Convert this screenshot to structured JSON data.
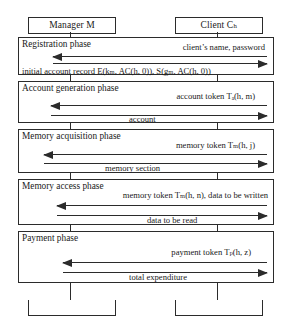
{
  "diagram": {
    "type": "sequence-diagram",
    "actors": [
      {
        "id": "manager",
        "label": "Manager M"
      },
      {
        "id": "client",
        "label": "Client Cₕ"
      }
    ],
    "footer_actors": [
      {
        "id": "manager",
        "label": "Manager M"
      },
      {
        "id": "client",
        "label": "Client Cₕ"
      }
    ],
    "phases": [
      {
        "id": "registration",
        "title": "Registration phase",
        "messages": [
          {
            "direction": "left",
            "label": "client’s name, password"
          },
          {
            "direction": "right",
            "label": "initial account record E(kₘ, AC(h, 0)), S(gₘ, AC(h, 0))"
          }
        ]
      },
      {
        "id": "account-generation",
        "title": "Account generation phase",
        "messages": [
          {
            "direction": "left",
            "label": "account token Tₐ(h, m)"
          },
          {
            "direction": "right",
            "label": "account"
          }
        ]
      },
      {
        "id": "memory-acquisition",
        "title": "Memory acquisition phase",
        "messages": [
          {
            "direction": "left",
            "label": "memory token Tₘ(h, j)"
          },
          {
            "direction": "right",
            "label": "memory section"
          }
        ]
      },
      {
        "id": "memory-access",
        "title": "Memory access phase",
        "messages": [
          {
            "direction": "left",
            "label": "memory token Tₘ(h, n), data to be written"
          },
          {
            "direction": "right",
            "label": "data to be read"
          }
        ]
      },
      {
        "id": "payment",
        "title": "Payment phase",
        "messages": [
          {
            "direction": "left",
            "label": "payment token Tₚ(h, z)"
          },
          {
            "direction": "right",
            "label": "total expenditure"
          }
        ]
      }
    ],
    "colors": {
      "stroke": "#2b2b2b",
      "background": "#ffffff"
    }
  }
}
